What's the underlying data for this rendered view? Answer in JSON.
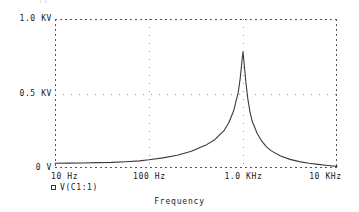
{
  "top_partial_text": "·  ·,,   ···",
  "legend": {
    "marker": "square-outline-marker",
    "label": "V(C1:1)"
  },
  "axis_title": "Frequency",
  "chart_data": {
    "type": "line",
    "title": "",
    "xlabel": "Frequency",
    "ylabel": "",
    "xscale": "log",
    "xlim": [
      10,
      10000
    ],
    "ylim": [
      0,
      1000
    ],
    "grid": true,
    "legend_position": "below-left",
    "xticks": [
      {
        "value": 10,
        "label": "10 Hz"
      },
      {
        "value": 100,
        "label": "100 Hz"
      },
      {
        "value": 1000,
        "label": "1.0 KHz"
      },
      {
        "value": 10000,
        "label": "10 KHz"
      }
    ],
    "yticks": [
      {
        "value": 0,
        "label": "0 V"
      },
      {
        "value": 500,
        "label": "0.5 KV"
      },
      {
        "value": 1000,
        "label": "1.0 KV"
      }
    ],
    "series": [
      {
        "name": "V(C1:1)",
        "color": "#3a3a3a",
        "resonance_hz": 1000,
        "peak_value_v": 780,
        "x": [
          10,
          14,
          20,
          28,
          40,
          56,
          79,
          100,
          141,
          200,
          282,
          398,
          501,
          631,
          708,
          794,
          891,
          933,
          955,
          977,
          1000,
          1023,
          1047,
          1072,
          1122,
          1189,
          1259,
          1413,
          1585,
          1778,
          2000,
          2512,
          3162,
          3981,
          5012,
          6310,
          7943,
          10000
        ],
        "y": [
          32,
          33,
          34,
          36,
          38,
          42,
          48,
          55,
          68,
          86,
          112,
          152,
          190,
          253,
          305,
          382,
          510,
          600,
          660,
          725,
          780,
          718,
          648,
          578,
          470,
          372,
          310,
          233,
          180,
          142,
          115,
          80,
          58,
          43,
          32,
          24,
          17,
          11
        ]
      }
    ]
  }
}
